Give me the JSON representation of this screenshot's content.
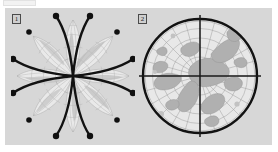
{
  "page": {
    "width": 278,
    "height": 152,
    "background": "#ffffff"
  },
  "toolbar_fragment": {
    "name": "cropped-toolbar-strip",
    "color": "#f2f2f2",
    "border_color": "#e2e2e2"
  },
  "figure_panel": {
    "background": "#d7d7d7",
    "x": 5,
    "y": 8,
    "width": 267,
    "height": 137
  },
  "figures": [
    {
      "id": "1",
      "label": "1",
      "name": "interrupted-star-projection",
      "title": "Interrupted star map projection",
      "lobes": 8,
      "stroke_color": "#121212",
      "graticule_color": "#9a9a9a",
      "land_color": "#b8b8b8",
      "ocean_color": "#e6e6e6",
      "tip_marker": "filled-circle",
      "tip_marker_count": 12,
      "center": {
        "x": 62,
        "y": 66
      }
    },
    {
      "id": "2",
      "label": "2",
      "name": "polar-azimuthal-projection",
      "title": "Polar azimuthal map projection",
      "stroke_color": "#121212",
      "graticule_color": "#9a9a9a",
      "land_color": "#b0b0b0",
      "ocean_color": "#e8e8e8",
      "axes": "crosshair",
      "parallels": 6,
      "meridians": 12,
      "center": {
        "x": 63,
        "y": 66
      },
      "radius": 58
    }
  ]
}
